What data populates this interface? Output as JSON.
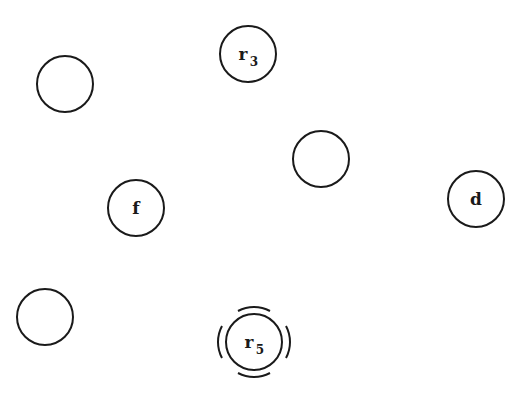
{
  "diagram": {
    "type": "node-graph",
    "style": {
      "stroke": "#1a1a1a",
      "fill": "#ffffff",
      "background": "#ffffff"
    },
    "nodes": [
      {
        "id": "n1",
        "label": "",
        "sub": "",
        "cx": 65,
        "cy": 84,
        "r": 28
      },
      {
        "id": "r3",
        "label": "r",
        "sub": "3",
        "cx": 248,
        "cy": 54,
        "r": 28
      },
      {
        "id": "n3",
        "label": "",
        "sub": "",
        "cx": 321,
        "cy": 159,
        "r": 28
      },
      {
        "id": "f",
        "label": "f",
        "sub": "",
        "cx": 136,
        "cy": 208,
        "r": 28
      },
      {
        "id": "d",
        "label": "d",
        "sub": "",
        "cx": 476,
        "cy": 199,
        "r": 28
      },
      {
        "id": "n6",
        "label": "",
        "sub": "",
        "cx": 45,
        "cy": 317,
        "r": 28
      },
      {
        "id": "r5",
        "label": "r",
        "sub": "5",
        "cx": 254,
        "cy": 342,
        "r": 28,
        "highlighted": true
      }
    ]
  }
}
